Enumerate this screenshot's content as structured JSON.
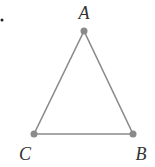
{
  "diagram": {
    "type": "triangle",
    "line_color": "#8a8a8a",
    "point_color": "#8a8a8a",
    "points": [
      {
        "label": "A",
        "x": 84,
        "y": 31,
        "label_x": 84,
        "label_y": 18
      },
      {
        "label": "B",
        "x": 133,
        "y": 134,
        "label_x": 142,
        "label_y": 160
      },
      {
        "label": "C",
        "x": 34,
        "y": 134,
        "label_x": 24,
        "label_y": 160
      }
    ]
  }
}
